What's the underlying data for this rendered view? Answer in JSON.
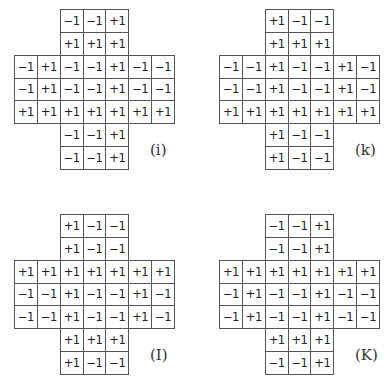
{
  "figure": {
    "cell_values_legend": [
      "+1",
      "-1"
    ],
    "layout": "cross-shaped 7x7 grids (3-wide vertical arm, 3-tall horizontal arm)",
    "panels": [
      {
        "label": "(i)",
        "rows": [
          [
            null,
            null,
            "−1",
            "−1",
            "+1",
            null,
            null
          ],
          [
            null,
            null,
            "+1",
            "+1",
            "+1",
            null,
            null
          ],
          [
            "−1",
            "+1",
            "−1",
            "−1",
            "+1",
            "−1",
            "−1"
          ],
          [
            "−1",
            "+1",
            "−1",
            "−1",
            "+1",
            "−1",
            "−1"
          ],
          [
            "+1",
            "+1",
            "+1",
            "+1",
            "+1",
            "+1",
            "+1"
          ],
          [
            null,
            null,
            "−1",
            "−1",
            "+1",
            null,
            null
          ],
          [
            null,
            null,
            "−1",
            "−1",
            "+1",
            null,
            null
          ]
        ]
      },
      {
        "label": "(k)",
        "rows": [
          [
            null,
            null,
            "+1",
            "−1",
            "−1",
            null,
            null
          ],
          [
            null,
            null,
            "+1",
            "+1",
            "+1",
            null,
            null
          ],
          [
            "−1",
            "−1",
            "+1",
            "−1",
            "−1",
            "+1",
            "−1"
          ],
          [
            "−1",
            "−1",
            "+1",
            "−1",
            "−1",
            "+1",
            "−1"
          ],
          [
            "+1",
            "+1",
            "+1",
            "+1",
            "+1",
            "+1",
            "+1"
          ],
          [
            null,
            null,
            "+1",
            "−1",
            "−1",
            null,
            null
          ],
          [
            null,
            null,
            "+1",
            "−1",
            "−1",
            null,
            null
          ]
        ]
      },
      {
        "label": "(I)",
        "rows": [
          [
            null,
            null,
            "+1",
            "−1",
            "−1",
            null,
            null
          ],
          [
            null,
            null,
            "+1",
            "−1",
            "−1",
            null,
            null
          ],
          [
            "+1",
            "+1",
            "+1",
            "+1",
            "+1",
            "+1",
            "+1"
          ],
          [
            "−1",
            "−1",
            "+1",
            "−1",
            "−1",
            "+1",
            "−1"
          ],
          [
            "−1",
            "−1",
            "+1",
            "−1",
            "−1",
            "+1",
            "−1"
          ],
          [
            null,
            null,
            "+1",
            "+1",
            "+1",
            null,
            null
          ],
          [
            null,
            null,
            "+1",
            "−1",
            "−1",
            null,
            null
          ]
        ]
      },
      {
        "label": "(K)",
        "rows": [
          [
            null,
            null,
            "−1",
            "−1",
            "+1",
            null,
            null
          ],
          [
            null,
            null,
            "−1",
            "−1",
            "+1",
            null,
            null
          ],
          [
            "+1",
            "+1",
            "+1",
            "+1",
            "+1",
            "+1",
            "+1"
          ],
          [
            "−1",
            "+1",
            "−1",
            "−1",
            "+1",
            "−1",
            "−1"
          ],
          [
            "−1",
            "+1",
            "−1",
            "−1",
            "+1",
            "−1",
            "−1"
          ],
          [
            null,
            null,
            "+1",
            "+1",
            "+1",
            null,
            null
          ],
          [
            null,
            null,
            "−1",
            "−1",
            "+1",
            null,
            null
          ]
        ]
      }
    ]
  }
}
